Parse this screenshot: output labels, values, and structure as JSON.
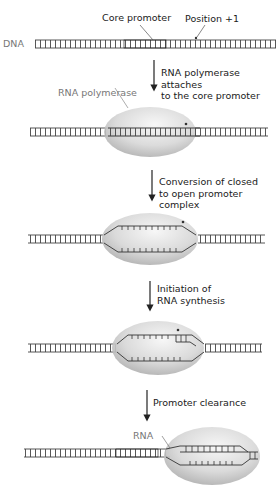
{
  "diagram": {
    "top_labels": {
      "dna": "DNA",
      "core_promoter": "Core promoter",
      "position_plus_one": "Position +1"
    },
    "polymerase_label": "RNA polymerase",
    "rna_label": "RNA",
    "steps": [
      {
        "line1": "RNA polymerase attaches",
        "line2": "to the core promoter"
      },
      {
        "line1": "Conversion of closed",
        "line2": "to open promoter complex"
      },
      {
        "line1": "Initiation of",
        "line2": "RNA synthesis"
      },
      {
        "line1": "Promoter clearance",
        "line2": ""
      }
    ],
    "stages": [
      "free DNA with core promoter",
      "closed promoter complex",
      "open promoter complex",
      "initiation of RNA synthesis",
      "promoter clearance"
    ],
    "colors": {
      "dna": "#333333",
      "polymerase_fill": "#cfcfcf",
      "polymerase_highlight": "#f2f2f2",
      "label_gray": "#777777"
    }
  }
}
